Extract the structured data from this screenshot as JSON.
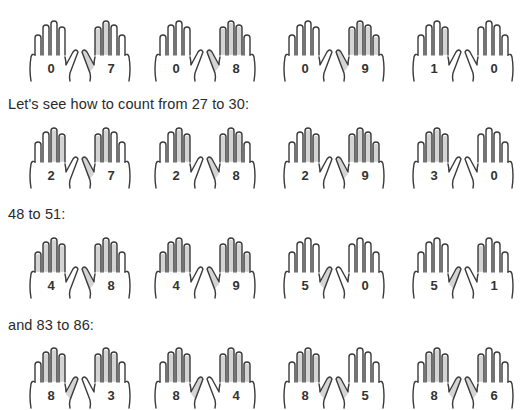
{
  "captions": [
    "Let's see how to count from 27 to 30:",
    "48 to 51:",
    "and 83 to 86:"
  ],
  "colors": {
    "shade": "#d4d4d4",
    "outline": "#3a3a3a",
    "text": "#2a2a2a"
  },
  "rows": [
    {
      "pairs": [
        {
          "left": "0",
          "right": "7"
        },
        {
          "left": "0",
          "right": "8"
        },
        {
          "left": "0",
          "right": "9"
        },
        {
          "left": "1",
          "right": "0"
        }
      ]
    },
    {
      "pairs": [
        {
          "left": "2",
          "right": "7"
        },
        {
          "left": "2",
          "right": "8"
        },
        {
          "left": "2",
          "right": "9"
        },
        {
          "left": "3",
          "right": "0"
        }
      ]
    },
    {
      "pairs": [
        {
          "left": "4",
          "right": "8"
        },
        {
          "left": "4",
          "right": "9"
        },
        {
          "left": "5",
          "right": "0"
        },
        {
          "left": "5",
          "right": "1"
        }
      ]
    },
    {
      "pairs": [
        {
          "left": "8",
          "right": "3"
        },
        {
          "left": "8",
          "right": "4"
        },
        {
          "left": "8",
          "right": "5"
        },
        {
          "left": "8",
          "right": "6"
        }
      ]
    }
  ]
}
